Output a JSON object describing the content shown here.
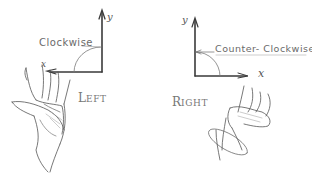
{
  "diagram": {
    "left": {
      "hand": "Left",
      "title_initial": "L",
      "title_rest": "EFT",
      "rotation_label": "Clockwise",
      "x_axis_label": "x",
      "y_axis_label": "y",
      "x_axis_direction": "left",
      "y_axis_direction": "up"
    },
    "right": {
      "hand": "Right",
      "title_initial": "R",
      "title_rest": "IGHT",
      "rotation_label": "Counter- Clockwise",
      "x_axis_label": "x",
      "y_axis_label": "y",
      "x_axis_direction": "right",
      "y_axis_direction": "up"
    },
    "colors": {
      "ink": "#3a3a3a",
      "pencil": "#8a8a8a",
      "background": "#ffffff"
    }
  }
}
